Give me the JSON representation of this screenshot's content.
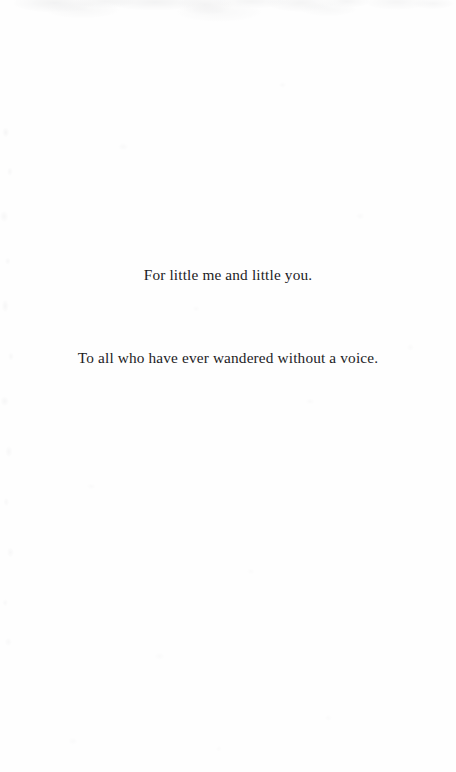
{
  "page": {
    "type": "book-dedication-page",
    "background_color": "#fefefe",
    "text_color": "#1c1c1e"
  },
  "dedication": {
    "lines": [
      "For little me and little you.",
      "To all who have ever wandered without a voice."
    ]
  }
}
